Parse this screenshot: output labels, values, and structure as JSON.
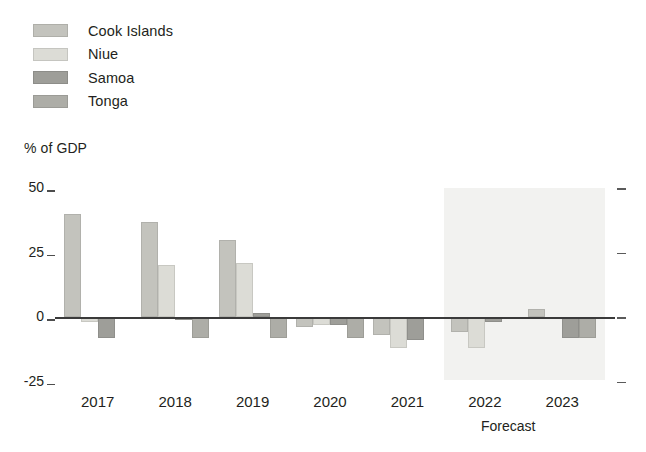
{
  "chart_data": {
    "type": "bar",
    "title": "",
    "subtitle": "",
    "xlabel": "",
    "ylabel": "% of GDP",
    "categories": [
      "2017",
      "2018",
      "2019",
      "2020",
      "2021",
      "2022",
      "2023"
    ],
    "series": [
      {
        "name": "Cook Islands",
        "color": "#c3c3bd",
        "values": [
          40,
          37,
          30,
          -4,
          -7,
          -6,
          3
        ]
      },
      {
        "name": "Niue",
        "color": "#dcdcd6",
        "values": [
          -2,
          20,
          21,
          -3,
          -12,
          -12,
          0
        ]
      },
      {
        "name": "Samoa",
        "color": "#9e9e99",
        "values": [
          -8,
          -1,
          1.5,
          -3,
          -9,
          -2,
          -8
        ]
      },
      {
        "name": "Tonga",
        "color": "#adada7",
        "values": [
          0,
          -8,
          -8,
          -8,
          0,
          0,
          -8
        ]
      }
    ],
    "ylim": [
      -25,
      50
    ],
    "yticks": [
      50,
      25,
      0,
      -25
    ],
    "ytick_labels": [
      "50",
      "25",
      "0",
      "-25"
    ],
    "grid": false,
    "legend_position": "top-left",
    "zero_line": true,
    "annotations": [
      {
        "text": "Forecast",
        "type": "region-label",
        "covers": [
          "2022",
          "2023"
        ]
      }
    ],
    "shaded_regions": [
      {
        "label": "Forecast",
        "from": "2022",
        "to": "2023",
        "color": "#f2f2f0"
      }
    ]
  },
  "legend": {
    "items": [
      {
        "label": "Cook Islands",
        "color": "#c3c3bd"
      },
      {
        "label": "Niue",
        "color": "#dcdcd6"
      },
      {
        "label": "Samoa",
        "color": "#9e9e99"
      },
      {
        "label": "Tonga",
        "color": "#adada7"
      }
    ]
  },
  "axis": {
    "y_title": "% of GDP",
    "y_labels": [
      "50",
      "25",
      "0",
      "-25"
    ],
    "x_labels": [
      "2017",
      "2018",
      "2019",
      "2020",
      "2021",
      "2022",
      "2023"
    ]
  },
  "forecast": {
    "label": "Forecast"
  }
}
